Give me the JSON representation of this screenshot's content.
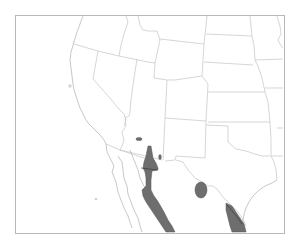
{
  "map": {
    "type": "species-range-map",
    "region": "Southwestern United States and northern Mexico",
    "frame": {
      "x": 15,
      "y": 15,
      "width": 269,
      "height": 218
    },
    "colors": {
      "background": "#ffffff",
      "frame": "#b8b8b8",
      "borders": "#c4c4c4",
      "range_fill": "#6e6e6e",
      "range_stroke": "#555555"
    },
    "range_areas": [
      {
        "name": "sonora-sinaloa-corridor",
        "description": "Elongated range from SE Arizona south along western Mexico"
      },
      {
        "name": "central-arizona-patch",
        "description": "Small isolated patch in central Arizona"
      },
      {
        "name": "se-arizona-nm-patch",
        "description": "Small patch near Arizona/New Mexico border"
      },
      {
        "name": "big-bend-patch",
        "description": "Oval patch in west Texas / Coahuila"
      },
      {
        "name": "south-texas-tamaulipas",
        "description": "Range in south Texas and Tamaulipas near Gulf coast"
      }
    ]
  }
}
